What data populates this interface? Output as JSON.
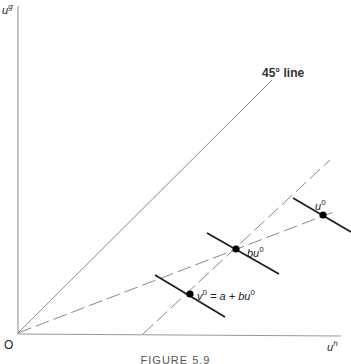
{
  "figure": {
    "caption": "FIGURE 5.9",
    "origin_label": "O",
    "y_axis": {
      "label": "u",
      "superscript": "g"
    },
    "x_axis": {
      "label": "u",
      "superscript": "h"
    },
    "line_45": {
      "label": "45° line"
    },
    "points": [
      {
        "id": "u0",
        "label": "u",
        "superscript": "0"
      },
      {
        "id": "bu0",
        "label": "bu",
        "superscript": "0"
      },
      {
        "id": "v0",
        "label": "v",
        "superscript": "0",
        "equation": "= a + bu",
        "equation_superscript": "0"
      }
    ],
    "colors": {
      "line": "#777777",
      "thick": "#1a1a1a",
      "point": "#000000",
      "axis": "#888888"
    }
  }
}
